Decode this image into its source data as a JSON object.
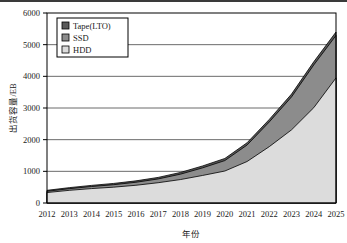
{
  "figure": {
    "background_color": "#ffffff",
    "top_rule_color": "#3a3a3a",
    "plot_border_color": "#000000",
    "gridline_color": "#5a5a5a"
  },
  "legend": {
    "position": "top-left-inside",
    "border_color": "#000000",
    "entries": [
      {
        "label": "Tape(LTO)",
        "color": "#595959"
      },
      {
        "label": "SSD",
        "color": "#8c8c8c"
      },
      {
        "label": "HDD",
        "color": "#dcdcdc"
      }
    ]
  },
  "axes": {
    "y_title": "出货容量/EB",
    "x_title": "年份",
    "y_ticks": [
      "0",
      "1000",
      "2000",
      "3000",
      "4000",
      "5000",
      "6000"
    ],
    "x_ticks": [
      "2012",
      "2013",
      "2014",
      "2015",
      "2016",
      "2017",
      "2018",
      "2019",
      "2020",
      "2021",
      "2022",
      "2023",
      "2024",
      "2025"
    ]
  },
  "chart_data": {
    "type": "area",
    "stacked": true,
    "title": "",
    "xlabel": "年份",
    "ylabel": "出货容量/EB",
    "ylim": [
      0,
      6000
    ],
    "grid": true,
    "legend_position": "upper left",
    "categories": [
      "2012",
      "2013",
      "2014",
      "2015",
      "2016",
      "2017",
      "2018",
      "2019",
      "2020",
      "2021",
      "2022",
      "2023",
      "2024",
      "2025"
    ],
    "series": [
      {
        "name": "HDD",
        "color": "#dcdcdc",
        "values": [
          330,
          400,
          455,
          500,
          560,
          640,
          740,
          870,
          1010,
          1310,
          1780,
          2310,
          3010,
          3950
        ]
      },
      {
        "name": "SSD",
        "color": "#8c8c8c",
        "values": [
          40,
          52,
          65,
          78,
          95,
          120,
          170,
          240,
          330,
          520,
          780,
          1040,
          1350,
          1340
        ]
      },
      {
        "name": "Tape(LTO)",
        "color": "#595959",
        "values": [
          30,
          33,
          36,
          40,
          44,
          48,
          54,
          60,
          66,
          72,
          80,
          90,
          100,
          110
        ]
      }
    ],
    "totals": [
      400,
      485,
      556,
      618,
      699,
      808,
      964,
      1170,
      1406,
      1902,
      2640,
      3440,
      4460,
      5400
    ]
  }
}
